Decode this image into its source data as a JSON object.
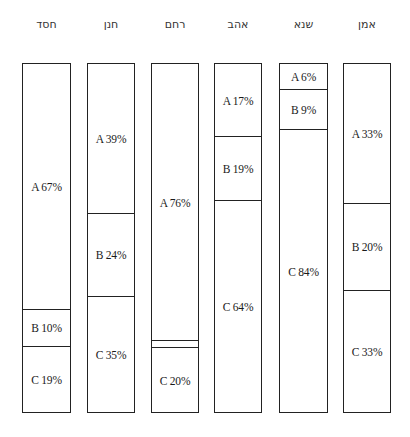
{
  "chart_data": {
    "type": "bar",
    "stacked": true,
    "orientation": "vertical",
    "title": "",
    "xlabel": "",
    "ylabel": "",
    "ylim": [
      0,
      100
    ],
    "grid": false,
    "legend": null,
    "categories": [
      "חסד",
      "חנן",
      "רחם",
      "אהב",
      "שנא",
      "אמן"
    ],
    "series": [
      {
        "name": "A",
        "values": [
          67,
          39,
          76,
          17,
          6,
          33
        ]
      },
      {
        "name": "B",
        "values": [
          10,
          24,
          null,
          19,
          9,
          20
        ]
      },
      {
        "name": "C",
        "values": [
          19,
          35,
          20,
          64,
          84,
          33
        ]
      }
    ]
  },
  "chart": {
    "top": 63,
    "bottom": 413,
    "bars": [
      {
        "label": "חסד",
        "x": 22,
        "w": 49,
        "dividers": [
          309,
          346
        ],
        "segments": [
          {
            "text": "A 67%"
          },
          {
            "text": "B 10%"
          },
          {
            "text": "C 19%"
          }
        ]
      },
      {
        "label": "חנן",
        "x": 87,
        "w": 48,
        "dividers": [
          213,
          296
        ],
        "segments": [
          {
            "text": "A 39%"
          },
          {
            "text": "B 24%"
          },
          {
            "text": "C 35%"
          }
        ]
      },
      {
        "label": "רחם",
        "x": 151,
        "w": 48,
        "dividers": [
          340,
          347
        ],
        "segments": [
          {
            "text": "A 76%"
          },
          {
            "text": ""
          },
          {
            "text": "C 20%"
          }
        ]
      },
      {
        "label": "אהב",
        "x": 214,
        "w": 48,
        "dividers": [
          136,
          200
        ],
        "segments": [
          {
            "text": "A 17%"
          },
          {
            "text": "B 19%"
          },
          {
            "text": "C 64%"
          }
        ]
      },
      {
        "label": "שנא",
        "x": 279,
        "w": 49,
        "dividers": [
          89,
          129
        ],
        "segments": [
          {
            "text": "A 6%"
          },
          {
            "text": "B 9%"
          },
          {
            "text": "C 84%"
          }
        ]
      },
      {
        "label": "אמן",
        "x": 343,
        "w": 48,
        "dividers": [
          203,
          290
        ],
        "segments": [
          {
            "text": "A 33%"
          },
          {
            "text": "B 20%"
          },
          {
            "text": "C 33%"
          }
        ]
      }
    ]
  }
}
